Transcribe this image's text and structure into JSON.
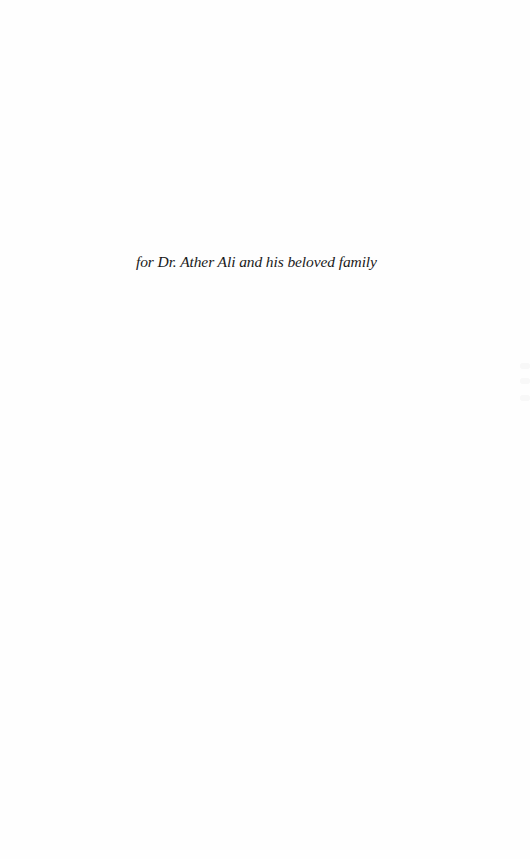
{
  "page": {
    "dedication": "for Dr. Ather Ali and his beloved family"
  }
}
